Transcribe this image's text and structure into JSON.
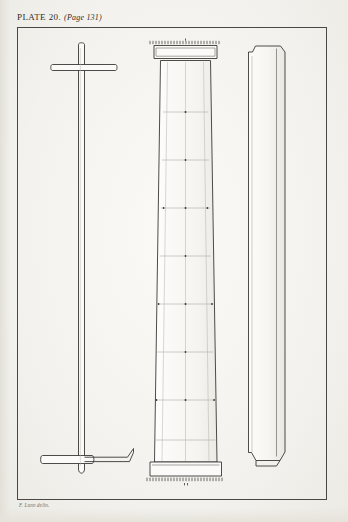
{
  "page": {
    "width": 348,
    "height": 522,
    "background_color": "#f4f2ee",
    "ink_color": "#3a3835",
    "frame_color": "#4a4845"
  },
  "header": {
    "plate_label": "PLATE 20.",
    "page_reference": "(Page 131)"
  },
  "credit": {
    "text": "F. Lunn delin."
  },
  "figures": [
    {
      "id": "figure-left",
      "name": "cross-staff-rod",
      "description": "Slender vertical rod with a horizontal crossbar near the top and a second crossbar with an upturned hooked end near the foot; rounded foot."
    },
    {
      "id": "figure-center",
      "name": "tapered-column-elevation",
      "description": "Tall tapering column shown in elevation with moulded capital at the top and spreading plinth base; faint measured grid of joint lines with point marks; stippled hatching along top and base edges."
    },
    {
      "id": "figure-right",
      "name": "column-side-slab",
      "description": "Tall narrow slab seen edgewise with a notched chamfer at the upper left corner and stepped chamfers at the foot."
    }
  ],
  "annotations": {
    "top_hatch": "stipple-dotted-edge",
    "base_hatch": "stipple-dotted-edge",
    "joint_marks": "dot-at-grid-intersection"
  }
}
